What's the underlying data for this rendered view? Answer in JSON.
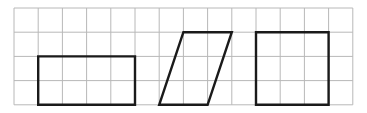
{
  "grid": {
    "origin_x": 14,
    "origin_y": 8,
    "cell": 24.2,
    "columns": 14,
    "rows": 4,
    "line_color": "#b8b8b8"
  },
  "shapes": [
    {
      "name": "rectangle",
      "points": [
        [
          1,
          2
        ],
        [
          5,
          2
        ],
        [
          5,
          4
        ],
        [
          1,
          4
        ]
      ]
    },
    {
      "name": "parallelogram",
      "points": [
        [
          7,
          1
        ],
        [
          9,
          1
        ],
        [
          8,
          4
        ],
        [
          6,
          4
        ]
      ]
    },
    {
      "name": "square",
      "points": [
        [
          10,
          1
        ],
        [
          13,
          1
        ],
        [
          13,
          4
        ],
        [
          10,
          4
        ]
      ]
    }
  ],
  "shape_stroke": "#1a1a1a"
}
